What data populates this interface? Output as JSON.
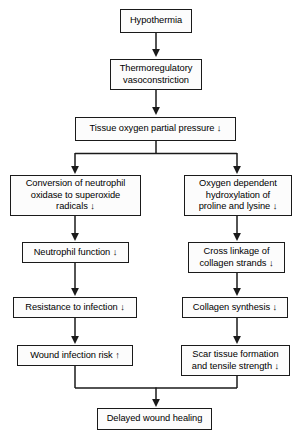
{
  "diagram": {
    "stroke_color": "#1a1a1a",
    "box_fill": "#fcfcfc",
    "nodes": {
      "hypothermia": "Hypothermia",
      "vasoconstriction_line1": "Thermoregulatory",
      "vasoconstriction_line2": "vasoconstriction",
      "tissue_oxygen": "Tissue oxygen partial pressure ↓",
      "neutrophil_oxidase_line1": "Conversion of neutrophil",
      "neutrophil_oxidase_line2": "oxidase to superoxide",
      "neutrophil_oxidase_line3": "radicals ↓",
      "hydroxylation_line1": "Oxygen dependent",
      "hydroxylation_line2": "hydroxylation of",
      "hydroxylation_line3": "proline and lysine ↓",
      "neutrophil_function": "Neutrophil function ↓",
      "cross_linkage_line1": "Cross linkage of",
      "cross_linkage_line2": "collagen strands ↓",
      "resistance_infection": "Resistance to infection ↓",
      "collagen_synthesis": "Collagen synthesis ↓",
      "wound_infection_risk": "Wound infection risk ↑",
      "scar_tissue_line1": "Scar tissue formation",
      "scar_tissue_line2": "and tensile strength ↓",
      "delayed_healing": "Delayed wound healing"
    }
  }
}
